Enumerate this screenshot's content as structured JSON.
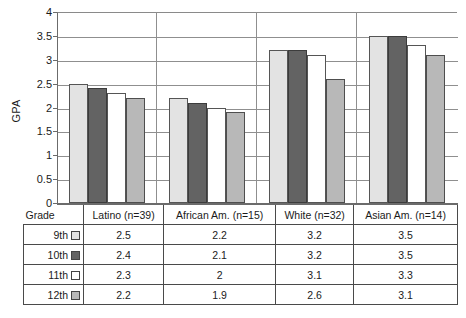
{
  "chart_data": {
    "type": "bar",
    "title": "",
    "xlabel": "",
    "ylabel": "GPA",
    "ylim": [
      0,
      4
    ],
    "yticks": [
      "0",
      "0.5",
      "1",
      "1.5",
      "2",
      "2.5",
      "3",
      "3.5",
      "4"
    ],
    "grid": true,
    "legend_position": "table-row-labels",
    "categories": [
      "Latino (n=39)",
      "African Am. (n=15)",
      "White (n=32)",
      "Asian Am. (n=14)"
    ],
    "series": [
      {
        "name": "9th",
        "color": "#e3e3e3",
        "values": [
          2.5,
          2.2,
          3.2,
          3.5
        ]
      },
      {
        "name": "10th",
        "color": "#636363",
        "values": [
          2.4,
          2.1,
          3.2,
          3.5
        ]
      },
      {
        "name": "11th",
        "color": "#ffffff",
        "values": [
          2.3,
          2.0,
          3.1,
          3.3
        ]
      },
      {
        "name": "12th",
        "color": "#b8b8b8",
        "values": [
          2.2,
          1.9,
          2.6,
          3.1
        ]
      }
    ]
  },
  "table": {
    "corner_label": "Grade",
    "columns": [
      "Latino (n=39)",
      "African Am. (n=15)",
      "White (n=32)",
      "Asian Am. (n=14)"
    ],
    "rows": [
      {
        "grade": "9th",
        "swatch": "legend-swatch-9th",
        "values": [
          "2.5",
          "2.2",
          "3.2",
          "3.5"
        ]
      },
      {
        "grade": "10th",
        "swatch": "legend-swatch-10th",
        "values": [
          "2.4",
          "2.1",
          "3.2",
          "3.5"
        ]
      },
      {
        "grade": "11th",
        "swatch": "legend-swatch-11th",
        "values": [
          "2.3",
          "2",
          "3.1",
          "3.3"
        ]
      },
      {
        "grade": "12th",
        "swatch": "legend-swatch-12th",
        "values": [
          "2.2",
          "1.9",
          "2.6",
          "3.1"
        ]
      }
    ]
  }
}
